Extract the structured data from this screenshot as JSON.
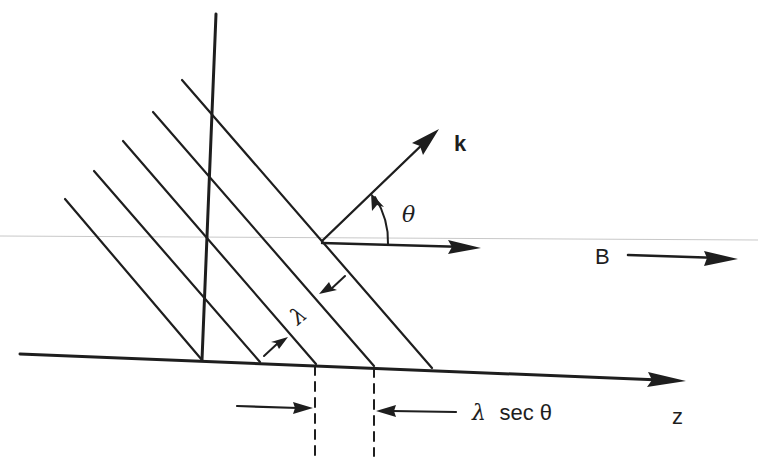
{
  "diagram": {
    "title": "",
    "colors": {
      "ink": "#1e1e1e",
      "background": "#ffffff",
      "scan_line": "#c8c8c8"
    },
    "labels": {
      "wave_vector": "k",
      "angle": "θ",
      "magnetic_field": "B",
      "wavelength": "λ",
      "projected_wavelength_lambda": "λ",
      "projected_wavelength_rest": "sec θ",
      "axis": "z"
    },
    "wavefronts": {
      "count": 5,
      "description": "parallel wave crests inclined to the z-axis"
    },
    "annotations": [
      {
        "name": "wave-vector-k",
        "text": "k",
        "description": "arrow normal to wavefronts"
      },
      {
        "name": "angle-theta",
        "text": "θ",
        "description": "angle between k and B"
      },
      {
        "name": "field-B",
        "text": "B",
        "description": "magnetic field along z"
      },
      {
        "name": "wavelength",
        "text": "λ",
        "description": "perpendicular spacing between wavefronts"
      },
      {
        "name": "projected-spacing",
        "text": "λ sec θ",
        "description": "spacing of wavefronts along z"
      }
    ]
  }
}
